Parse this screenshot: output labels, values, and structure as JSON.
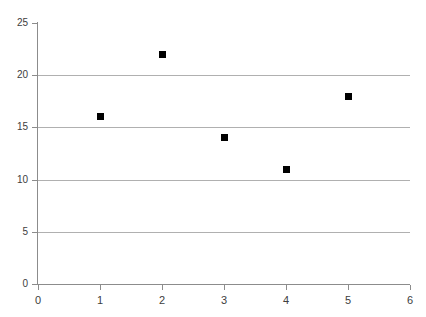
{
  "chart_data": {
    "type": "scatter",
    "title": "",
    "xlabel": "",
    "ylabel": "",
    "xlim": [
      0,
      6
    ],
    "ylim": [
      0,
      25
    ],
    "grid": "horizontal",
    "legend": "none",
    "marker": "filled-square",
    "marker_color": "#000000",
    "gridline_color": "#b0b0b0",
    "axis_color": "#8c8c8c",
    "background_color": "#ffffff",
    "x": [
      1,
      2,
      3,
      4,
      5
    ],
    "values": [
      16,
      22,
      14,
      11,
      18
    ],
    "points": [
      {
        "x": 1,
        "y": 16
      },
      {
        "x": 2,
        "y": 22
      },
      {
        "x": 3,
        "y": 14
      },
      {
        "x": 4,
        "y": 11
      },
      {
        "x": 5,
        "y": 18
      }
    ],
    "xticks": [
      0,
      1,
      2,
      3,
      4,
      5,
      6
    ],
    "xtick_labels": [
      "0",
      "1",
      "2",
      "3",
      "4",
      "5",
      "6"
    ],
    "yticks": [
      0,
      5,
      10,
      15,
      20,
      25
    ],
    "ytick_labels": [
      "0",
      "5",
      "10",
      "15",
      "20",
      "25"
    ],
    "gridline_values": [
      5,
      10,
      15,
      20
    ]
  }
}
